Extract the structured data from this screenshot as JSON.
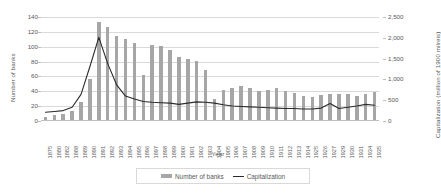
{
  "chart_data": {
    "type": "bar",
    "title": "",
    "xlabel": "Year",
    "ylabel": "Number of banks",
    "y2label": "Capitalization (million of 1900 milreis)",
    "grid": true,
    "legend_position": "bottom",
    "ylim": [
      0,
      140
    ],
    "y2lim": [
      0,
      2500
    ],
    "yticks": [
      "0",
      "20",
      "40",
      "60",
      "80",
      "100",
      "120",
      "140"
    ],
    "y2ticks": [
      "0",
      "500",
      "1,000",
      "1,500",
      "2,000",
      "2,500"
    ],
    "categories": [
      "1875",
      "1880",
      "1882",
      "1888",
      "1889",
      "1890",
      "1891",
      "1892",
      "1893",
      "1894",
      "1895",
      "1896",
      "1897",
      "1898",
      "1899",
      "1900",
      "1901",
      "1902",
      "1903",
      "1904",
      "1905",
      "1906",
      "1907",
      "1908",
      "1909",
      "1910",
      "1911",
      "1912",
      "1913",
      "1914",
      "1925",
      "1926",
      "1927",
      "1929",
      "1930",
      "1931",
      "1934",
      "1935"
    ],
    "series": [
      {
        "name": "Number of banks",
        "type": "bar",
        "axis": "left",
        "color": "#a6a6a6",
        "values": [
          6,
          8,
          9,
          14,
          26,
          57,
          133,
          126,
          115,
          110,
          105,
          62,
          103,
          101,
          96,
          86,
          84,
          81,
          69,
          30,
          42,
          45,
          47,
          45,
          40,
          42,
          44,
          41,
          38,
          34,
          33,
          35,
          36,
          36,
          37,
          34,
          36,
          39
        ]
      },
      {
        "name": "Capitalization",
        "type": "line",
        "axis": "right",
        "color": "#2b2b2b",
        "values": [
          210,
          230,
          250,
          330,
          640,
          1310,
          2010,
          1380,
          870,
          600,
          530,
          470,
          450,
          440,
          430,
          400,
          430,
          460,
          450,
          430,
          390,
          360,
          350,
          340,
          330,
          320,
          310,
          300,
          300,
          290,
          290,
          310,
          420,
          300,
          330,
          360,
          400,
          380
        ]
      }
    ]
  },
  "legend": {
    "items": [
      {
        "label": "Number of banks",
        "marker": "bar-swatch"
      },
      {
        "label": "Capitalization",
        "marker": "line-swatch"
      }
    ]
  }
}
